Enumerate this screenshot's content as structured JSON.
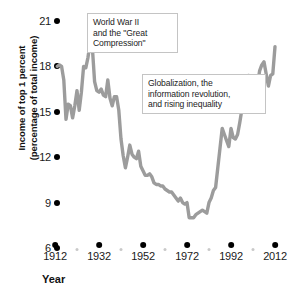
{
  "chart_data": {
    "type": "line",
    "title": "",
    "xlabel": "Year",
    "ylabel": "Income of top 1 percent (percentage of total income)",
    "xlim": [
      1912,
      2013
    ],
    "ylim": [
      6,
      21
    ],
    "grid": false,
    "legend": null,
    "line_color": "#9c9c9c",
    "x_ticks": [
      1912,
      1932,
      1952,
      1972,
      1992,
      2012
    ],
    "x_minor_ticks": [
      1922,
      1942,
      1962,
      1982,
      2002
    ],
    "y_ticks": [
      21,
      18,
      15,
      12,
      9,
      6
    ],
    "series": [
      {
        "name": "Income share of top 1 percent",
        "x": [
          1913,
          1914,
          1915,
          1916,
          1917,
          1918,
          1919,
          1920,
          1921,
          1922,
          1923,
          1924,
          1925,
          1926,
          1927,
          1928,
          1929,
          1930,
          1931,
          1932,
          1933,
          1934,
          1935,
          1936,
          1937,
          1938,
          1939,
          1940,
          1941,
          1942,
          1943,
          1944,
          1945,
          1946,
          1947,
          1948,
          1949,
          1950,
          1951,
          1952,
          1953,
          1954,
          1955,
          1956,
          1957,
          1958,
          1959,
          1960,
          1961,
          1962,
          1963,
          1964,
          1965,
          1966,
          1967,
          1968,
          1969,
          1970,
          1971,
          1972,
          1973,
          1974,
          1975,
          1976,
          1977,
          1978,
          1979,
          1980,
          1981,
          1982,
          1983,
          1984,
          1985,
          1986,
          1987,
          1988,
          1989,
          1990,
          1991,
          1992,
          1993,
          1994,
          1995,
          1996,
          1997,
          1998,
          1999,
          2000,
          2001,
          2002,
          2003,
          2004,
          2005,
          2006,
          2007,
          2008,
          2009,
          2010,
          2011,
          2012
        ],
        "values": [
          18.0,
          18.1,
          18.0,
          17.1,
          14.5,
          15.5,
          15.4,
          14.6,
          15.4,
          16.4,
          15.1,
          16.3,
          18.0,
          17.9,
          18.6,
          19.6,
          19.2,
          17.0,
          16.4,
          16.3,
          16.5,
          16.1,
          16.0,
          17.1,
          15.9,
          15.4,
          16.0,
          16.0,
          15.1,
          13.2,
          12.1,
          11.3,
          12.0,
          12.8,
          12.2,
          12.0,
          11.9,
          12.4,
          11.4,
          11.1,
          10.8,
          10.8,
          10.9,
          10.7,
          10.3,
          10.2,
          10.2,
          10.1,
          10.1,
          9.9,
          9.8,
          9.7,
          9.7,
          9.5,
          9.3,
          9.1,
          9.3,
          9.0,
          8.9,
          9.0,
          8.0,
          8.0,
          8.0,
          8.2,
          8.3,
          8.4,
          8.5,
          8.4,
          8.3,
          9.0,
          9.3,
          9.8,
          10.0,
          11.3,
          12.6,
          13.9,
          13.5,
          13.1,
          12.7,
          13.9,
          13.3,
          13.2,
          13.5,
          14.3,
          15.2,
          16.0,
          16.8,
          17.4,
          16.0,
          15.3,
          15.7,
          16.8,
          17.7,
          18.1,
          18.3,
          17.5,
          16.7,
          17.4,
          17.5,
          19.3
        ]
      }
    ],
    "annotations": [
      {
        "id": "ww2",
        "lines": [
          "World War II",
          "and the \"Great",
          "Compression\""
        ],
        "text": "World War II and the \"Great Compression\""
      },
      {
        "id": "globalization",
        "lines": [
          "Globalization, the",
          "information revolution,",
          "and rising inequality"
        ],
        "text": "Globalization, the information revolution, and rising inequality"
      }
    ]
  }
}
